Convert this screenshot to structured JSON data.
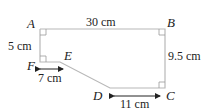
{
  "diagram": {
    "points": {
      "A": {
        "label": "A"
      },
      "B": {
        "label": "B"
      },
      "C": {
        "label": "C"
      },
      "D": {
        "label": "D"
      },
      "E": {
        "label": "E"
      },
      "F": {
        "label": "F"
      }
    },
    "measurements": {
      "AB": "30 cm",
      "AF": "5 cm",
      "BC": "9.5 cm",
      "FE": "7 cm",
      "DC": "11 cm"
    },
    "colors": {
      "shape_stroke": "#b8b8b8",
      "arrow": "#222222"
    }
  }
}
